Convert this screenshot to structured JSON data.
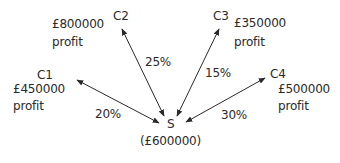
{
  "diagram": {
    "center": {
      "id": "S",
      "label": "S",
      "value": "(£600000)"
    },
    "nodes": [
      {
        "id": "C1",
        "label": "C1",
        "value": "£450000",
        "note": "profit",
        "probability": "20%"
      },
      {
        "id": "C2",
        "label": "C2",
        "value": "£800000",
        "note": "profit",
        "probability": "25%"
      },
      {
        "id": "C3",
        "label": "C3",
        "value": "£350000",
        "note": "profit",
        "probability": "15%"
      },
      {
        "id": "C4",
        "label": "C4",
        "value": "£500000",
        "note": "profit",
        "probability": "30%"
      }
    ],
    "colors": {
      "line": "#2a2a2a",
      "text": "#2a2a2a",
      "background": "#ffffff"
    }
  }
}
